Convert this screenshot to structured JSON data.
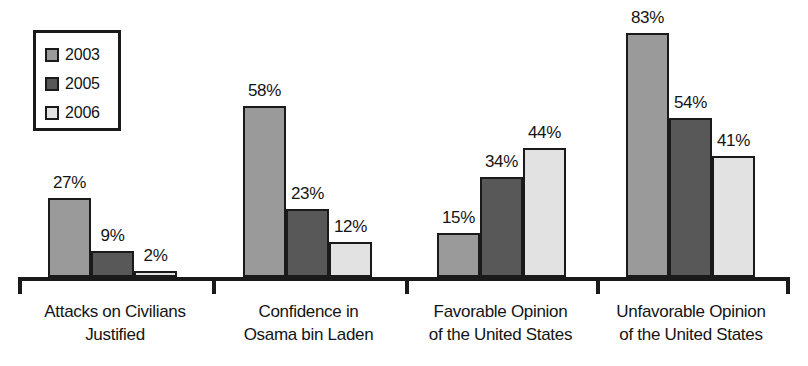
{
  "chart_data": {
    "type": "bar",
    "title": "",
    "subtitle": "",
    "xlabel": "",
    "ylabel": "",
    "ylim": [
      0,
      90
    ],
    "grid": false,
    "legend_position": "top-left",
    "value_suffix": "%",
    "categories": [
      "Attacks on Civilians Justified",
      "Confidence in Osama bin Laden",
      "Favorable Opinion of the United States",
      "Unfavorable Opinion of the United States"
    ],
    "category_lines": [
      [
        "Attacks on Civilians",
        "Justified"
      ],
      [
        "Confidence in",
        "Osama bin Laden"
      ],
      [
        "Favorable Opinion",
        "of the United States"
      ],
      [
        "Unfavorable Opinion",
        "of the United States"
      ]
    ],
    "series": [
      {
        "name": "2003",
        "color": "#9a9a9a",
        "values": [
          27,
          9,
          2,
          83
        ],
        "labels": [
          "27%",
          "9%",
          "2%",
          "83%"
        ]
      },
      {
        "name": "2005",
        "color": "#585858",
        "values": [
          9,
          23,
          34,
          54
        ],
        "labels": [
          "9%",
          "23%",
          "34%",
          "54%"
        ]
      },
      {
        "name": "2006",
        "color": "#e2e2e2",
        "values": [
          2,
          12,
          44,
          41
        ],
        "labels": [
          "2%",
          "12%",
          "44%",
          "41%"
        ]
      }
    ],
    "groups": [
      {
        "category_index": 0,
        "bars": [
          {
            "series": "2003",
            "value": 27,
            "label": "27%",
            "color": "#9a9a9a"
          },
          {
            "series": "2005",
            "value": 9,
            "label": "9%",
            "color": "#585858"
          },
          {
            "series": "2006",
            "value": 2,
            "label": "2%",
            "color": "#e2e2e2"
          }
        ]
      },
      {
        "category_index": 1,
        "bars": [
          {
            "series": "2003",
            "value": 58,
            "label": "58%",
            "color": "#9a9a9a"
          },
          {
            "series": "2005",
            "value": 23,
            "label": "23%",
            "color": "#585858"
          },
          {
            "series": "2006",
            "value": 12,
            "label": "12%",
            "color": "#e2e2e2"
          }
        ]
      },
      {
        "category_index": 2,
        "bars": [
          {
            "series": "2003",
            "value": 15,
            "label": "15%",
            "color": "#9a9a9a"
          },
          {
            "series": "2005",
            "value": 34,
            "label": "34%",
            "color": "#585858"
          },
          {
            "series": "2006",
            "value": 44,
            "label": "44%",
            "color": "#e2e2e2"
          }
        ]
      },
      {
        "category_index": 3,
        "bars": [
          {
            "series": "2003",
            "value": 83,
            "label": "83%",
            "color": "#9a9a9a"
          },
          {
            "series": "2005",
            "value": 54,
            "label": "54%",
            "color": "#585858"
          },
          {
            "series": "2006",
            "value": 41,
            "label": "41%",
            "color": "#e2e2e2"
          }
        ]
      }
    ]
  },
  "legend": {
    "items": [
      {
        "label": "2003",
        "color": "#9a9a9a"
      },
      {
        "label": "2005",
        "color": "#585858"
      },
      {
        "label": "2006",
        "color": "#e2e2e2"
      }
    ]
  },
  "axis": {
    "baseline_color": "#1a1a1a",
    "tick_count": 5
  },
  "layout": {
    "baseline_y": 277,
    "px_per_unit": 2.94,
    "bar_width": 43,
    "group_starts": [
      48,
      243,
      437,
      626
    ],
    "tick_positions": [
      18,
      212,
      405,
      596,
      786
    ]
  }
}
